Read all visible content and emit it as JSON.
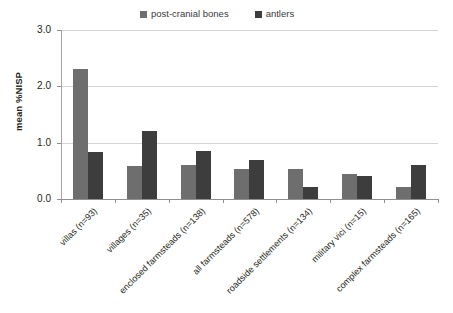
{
  "chart_data": {
    "type": "bar",
    "title": "",
    "subtitle": "",
    "xlabel": "",
    "ylabel": "mean %NISP",
    "ylim": [
      0.0,
      3.0
    ],
    "ytick_labels": [
      "0.0",
      "1.0",
      "2.0",
      "3.0"
    ],
    "ytick_values": [
      0.0,
      1.0,
      2.0,
      3.0
    ],
    "grid": "horizontal",
    "legend_position": "top-center",
    "categories": [
      "villas (n=93)",
      "villages (n=35)",
      "enclosed farmsteads (n=138)",
      "all farmsteads (n=578)",
      "roadside settlements (n=134)",
      "military vici (n=15)",
      "complex farmsteads (n=165)"
    ],
    "series": [
      {
        "name": "post-cranial bones",
        "color": "#6e6e6e",
        "values": [
          2.3,
          0.59,
          0.6,
          0.54,
          0.53,
          0.45,
          0.22
        ]
      },
      {
        "name": "antlers",
        "color": "#3d3d3d",
        "values": [
          0.84,
          1.2,
          0.86,
          0.69,
          0.22,
          0.4,
          0.6
        ]
      }
    ]
  },
  "legend": {
    "entries": [
      {
        "label": "post-cranial bones",
        "color": "#6e6e6e"
      },
      {
        "label": "antlers",
        "color": "#3d3d3d"
      }
    ]
  },
  "axis": {
    "y_title": "mean %NISP"
  },
  "colors": {
    "background": "#ffffff",
    "gridline": "#d4d4d4",
    "axis": "#8f8f8f",
    "text": "#231f20",
    "series_post_cranial": "#6e6e6e",
    "series_antlers": "#3d3d3d"
  }
}
